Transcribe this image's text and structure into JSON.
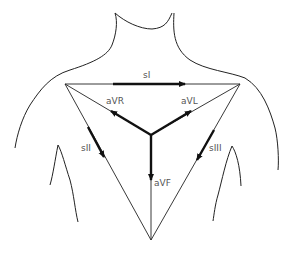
{
  "diagram": {
    "colors": {
      "outline": "#222222",
      "arrow": "#111111",
      "label": "#555555",
      "background": "#ffffff"
    },
    "labels": {
      "sI": "sI",
      "sII": "sII",
      "sIII": "sIII",
      "aVR": "aVR",
      "aVL": "aVL",
      "aVF": "aVF"
    },
    "vertices": {
      "left_shoulder": [
        65,
        84
      ],
      "right_shoulder": [
        240,
        84
      ],
      "bottom": [
        151,
        240
      ],
      "center": [
        151,
        135
      ]
    }
  }
}
